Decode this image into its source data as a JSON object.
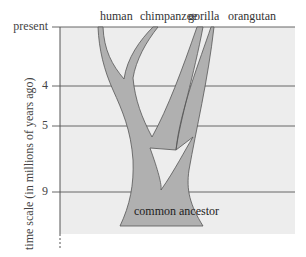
{
  "figure": {
    "species": [
      "human",
      "chimpanzee",
      "gorilla",
      "orangutan"
    ],
    "axis_title": "time scale (in millions of years ago)",
    "ticks": [
      {
        "label": "present",
        "y": 27
      },
      {
        "label": "4",
        "y": 86
      },
      {
        "label": "5",
        "y": 126
      },
      {
        "label": "9",
        "y": 192
      }
    ],
    "root_label": "common ancestor",
    "colors": {
      "panel": "#ededed",
      "branch_fill": "#b8b8b8",
      "trunk_fill": "#a8a8a8",
      "outline": "#555555",
      "gridline": "#666666"
    }
  }
}
